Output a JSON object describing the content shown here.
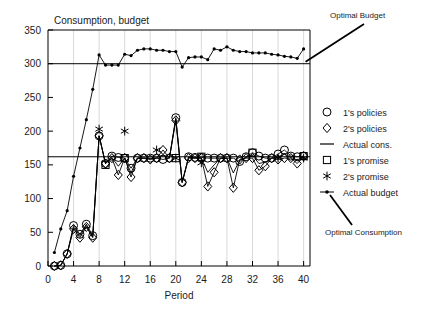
{
  "chart_data": {
    "type": "line",
    "title": "Consumption, budget",
    "xlabel": "Period",
    "ylabel": "",
    "xlim": [
      0,
      41
    ],
    "ylim": [
      0,
      350
    ],
    "xticks": [
      0,
      4,
      8,
      12,
      16,
      20,
      24,
      28,
      32,
      36,
      40
    ],
    "yticks": [
      0,
      50,
      100,
      150,
      200,
      250,
      300,
      350
    ],
    "grid": "vertical",
    "legend_position": "right",
    "reference_lines": [
      {
        "name": "Optimal Budget",
        "value": 300,
        "annotation": "Optimal Budget"
      },
      {
        "name": "Optimal Consumption",
        "value": 162,
        "annotation": "Optimal Consumption"
      }
    ],
    "series": [
      {
        "name": "1's policies",
        "marker": "circle",
        "x": [
          1,
          2,
          3,
          4,
          5,
          6,
          7,
          8,
          9,
          10,
          11,
          12,
          13,
          14,
          15,
          16,
          17,
          18,
          19,
          20,
          21,
          22,
          23,
          24,
          25,
          26,
          27,
          28,
          29,
          30,
          31,
          32,
          33,
          34,
          35,
          36,
          37,
          38,
          39,
          40
        ],
        "values": [
          0,
          1,
          18,
          60,
          47,
          62,
          45,
          193,
          152,
          163,
          161,
          160,
          145,
          160,
          160,
          160,
          160,
          158,
          160,
          220,
          124,
          162,
          161,
          161,
          160,
          160,
          160,
          160,
          160,
          155,
          162,
          168,
          163,
          160,
          160,
          166,
          172,
          163,
          162,
          163
        ]
      },
      {
        "name": "2's policies",
        "marker": "diamond",
        "x": [
          1,
          2,
          3,
          4,
          5,
          6,
          7,
          8,
          9,
          10,
          11,
          12,
          13,
          14,
          15,
          16,
          17,
          18,
          19,
          20,
          21,
          22,
          23,
          24,
          25,
          26,
          27,
          28,
          29,
          30,
          31,
          32,
          33,
          34,
          35,
          36,
          37,
          38,
          39,
          40
        ],
        "values": [
          0,
          1,
          18,
          55,
          42,
          58,
          42,
          193,
          152,
          160,
          135,
          160,
          132,
          160,
          160,
          158,
          160,
          172,
          160,
          216,
          124,
          160,
          160,
          160,
          118,
          139,
          160,
          160,
          116,
          158,
          160,
          160,
          142,
          148,
          160,
          158,
          160,
          160,
          152,
          163
        ]
      },
      {
        "name": "Actual cons.",
        "marker": "line",
        "x": [
          1,
          2,
          3,
          4,
          5,
          6,
          7,
          8,
          9,
          10,
          11,
          12,
          13,
          14,
          15,
          16,
          17,
          18,
          19,
          20,
          21,
          22,
          23,
          24,
          25,
          26,
          27,
          28,
          29,
          30,
          31,
          32,
          33,
          34,
          35,
          36,
          37,
          38,
          39,
          40
        ],
        "values": [
          0,
          1,
          18,
          57,
          45,
          60,
          43,
          193,
          152,
          161,
          148,
          160,
          138,
          160,
          160,
          159,
          160,
          165,
          160,
          218,
          124,
          161,
          160,
          160,
          139,
          150,
          160,
          160,
          138,
          157,
          161,
          164,
          152,
          154,
          160,
          162,
          166,
          161,
          157,
          163
        ]
      },
      {
        "name": "1's promise",
        "marker": "square",
        "x": [
          9,
          12,
          20,
          24,
          32,
          40
        ],
        "values": [
          150,
          160,
          160,
          162,
          168,
          163
        ]
      },
      {
        "name": "2's promise",
        "marker": "asterisk",
        "x": [
          8,
          12,
          17,
          20,
          24,
          36,
          40
        ],
        "values": [
          203,
          200,
          172,
          160,
          153,
          160,
          160
        ]
      },
      {
        "name": "Actual budget",
        "marker": "dot",
        "x": [
          1,
          2,
          3,
          4,
          5,
          6,
          7,
          8,
          9,
          10,
          11,
          12,
          13,
          14,
          15,
          16,
          17,
          18,
          19,
          20,
          21,
          22,
          23,
          24,
          25,
          26,
          27,
          28,
          29,
          30,
          31,
          32,
          33,
          34,
          35,
          36,
          37,
          38,
          39,
          40
        ],
        "values": [
          20,
          55,
          82,
          133,
          175,
          217,
          262,
          313,
          298,
          298,
          298,
          314,
          312,
          320,
          322,
          322,
          320,
          320,
          318,
          318,
          295,
          309,
          310,
          310,
          306,
          322,
          320,
          325,
          320,
          318,
          318,
          316,
          316,
          316,
          314,
          313,
          311,
          310,
          308,
          322
        ]
      }
    ]
  },
  "legend": {
    "items": [
      {
        "label": "1's policies",
        "marker": "circle"
      },
      {
        "label": "2's policies",
        "marker": "diamond"
      },
      {
        "label": "Actual cons.",
        "marker": "line"
      },
      {
        "label": "1's promise",
        "marker": "square"
      },
      {
        "label": "2's promise",
        "marker": "asterisk"
      },
      {
        "label": "Actual budget",
        "marker": "dot"
      }
    ]
  },
  "annotations": {
    "optimal_budget": "Optimal Budget",
    "optimal_consumption": "Optimal Consumption"
  },
  "colors": {
    "ink": "#000000",
    "grid": "#c8c8c8",
    "background": "#ffffff"
  }
}
